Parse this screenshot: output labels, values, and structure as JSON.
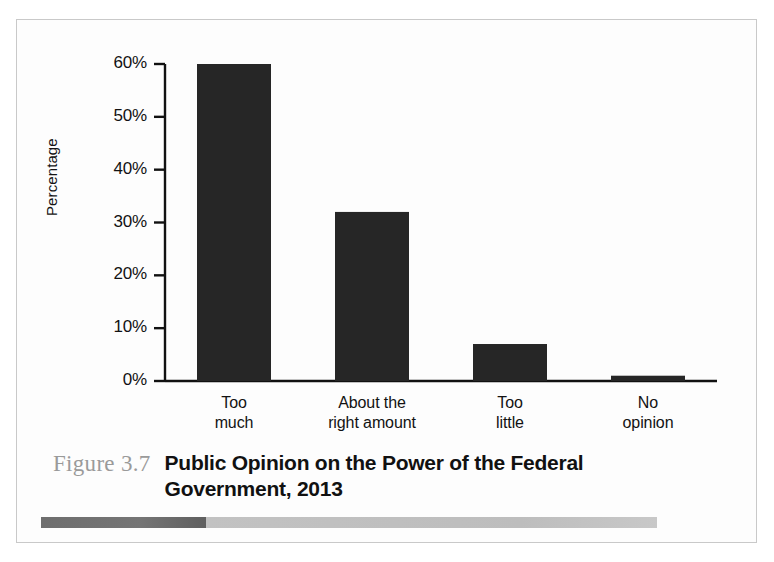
{
  "figure": {
    "number": "Figure 3.7",
    "title": "Public Opinion on the Power of the Federal Government, 2013"
  },
  "colors": {
    "bar": "#262626",
    "axis": "#111111",
    "frame": "#c9c9c9",
    "figure_number": "#9a9a9a",
    "rule_dark": "#6e6e6e",
    "rule_light": "#c2c2c2"
  },
  "chart_data": {
    "type": "bar",
    "title": "Public Opinion on the Power of the Federal Government, 2013",
    "xlabel": "",
    "ylabel": "Percentage",
    "categories": [
      "Too much",
      "About the right amount",
      "Too little",
      "No opinion"
    ],
    "category_lines": [
      [
        "Too",
        "much"
      ],
      [
        "About the",
        "right amount"
      ],
      [
        "Too",
        "little"
      ],
      [
        "No",
        "opinion"
      ]
    ],
    "values": [
      60,
      32,
      7,
      1
    ],
    "ylim": [
      0,
      60
    ],
    "yticks": [
      0,
      10,
      20,
      30,
      40,
      50,
      60
    ],
    "ytick_labels": [
      "0%",
      "10%",
      "20%",
      "30%",
      "40%",
      "50%",
      "60%"
    ],
    "grid": false,
    "legend": false
  }
}
